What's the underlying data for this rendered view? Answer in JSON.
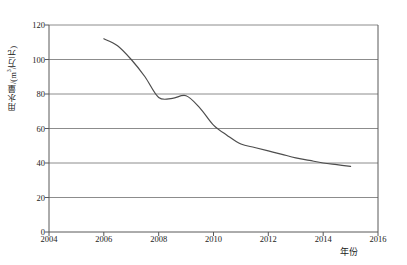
{
  "chart_data": {
    "type": "line",
    "title": "",
    "subtitle": "",
    "xlabel": "年份",
    "ylabel": "用水量/(m³/万元)",
    "ylabel_parts": {
      "name": "用水量",
      "sep": "/(m",
      "sup": "3",
      "rest": "/万元)"
    },
    "xlim": [
      2004,
      2016
    ],
    "ylim": [
      0,
      120
    ],
    "xticks": [
      2004,
      2006,
      2008,
      2010,
      2012,
      2014,
      2016
    ],
    "yticks": [
      0,
      20,
      40,
      60,
      80,
      100,
      120
    ],
    "xtick_labels": [
      "2004",
      "2006",
      "2008",
      "2010",
      "2012",
      "2014",
      "2016"
    ],
    "ytick_labels": [
      "0",
      "20",
      "40",
      "60",
      "80",
      "100",
      "120"
    ],
    "grid": {
      "horizontal": true,
      "vertical": false,
      "color": "#8c8c8c"
    },
    "legend": {
      "visible": false,
      "position": "none"
    },
    "series": [
      {
        "name": "用水量",
        "color": "#4d4d4d",
        "x": [
          2006,
          2006.5,
          2007,
          2007.5,
          2008,
          2008.5,
          2009,
          2009.5,
          2010,
          2010.5,
          2011,
          2011.5,
          2012,
          2012.5,
          2013,
          2013.5,
          2014,
          2014.5,
          2015
        ],
        "values": [
          112,
          108,
          100,
          90,
          78,
          77.5,
          79,
          72,
          62,
          56,
          51,
          49,
          47,
          45,
          43,
          41.5,
          40,
          39,
          38
        ]
      }
    ],
    "annotations": []
  },
  "figure": {
    "plot_area": {
      "left": 49,
      "right": 378,
      "top": 25,
      "bottom": 232
    },
    "frame_color": "#595959",
    "background": "#ffffff"
  }
}
